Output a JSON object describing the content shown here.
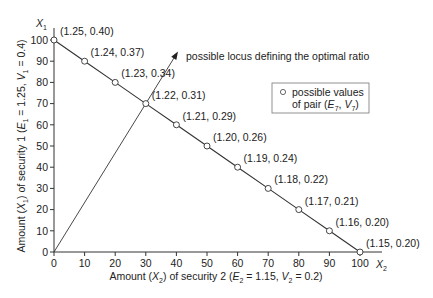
{
  "chart_data": {
    "type": "line",
    "title": "",
    "xlabel": "Amount (X2) of security 2 (E2 = 1.15, V2 = 0.2)",
    "ylabel": "Amount (X1) of security 1 (E1 = 1.25, V1 = 0.4)",
    "x_axis_symbol": "X2",
    "y_axis_symbol": "X1",
    "xlim": [
      0,
      100
    ],
    "ylim": [
      0,
      100
    ],
    "x_ticks": [
      0,
      10,
      20,
      30,
      40,
      50,
      60,
      70,
      80,
      90,
      100
    ],
    "y_ticks": [
      0,
      10,
      20,
      30,
      40,
      50,
      60,
      70,
      80,
      90,
      100
    ],
    "grid": false,
    "series": [
      {
        "name": "possible values of pair (E7, V7)",
        "x": [
          0,
          10,
          20,
          30,
          40,
          50,
          60,
          70,
          80,
          90,
          100
        ],
        "y": [
          100,
          90,
          80,
          70,
          60,
          50,
          40,
          30,
          20,
          10,
          0
        ],
        "labels": [
          "(1.25, 0.40)",
          "(1.24, 0.37)",
          "(1.23, 0.34)",
          "(1.22, 0.31)",
          "(1.21, 0.29)",
          "(1.20, 0.26)",
          "(1.19, 0.24)",
          "(1.18, 0.22)",
          "(1.17, 0.21)",
          "(1.16, 0.20)",
          "(1.15, 0.20)"
        ]
      },
      {
        "name": "possible locus defining the optimal ratio",
        "x": [
          0,
          30
        ],
        "y": [
          0,
          70
        ],
        "arrow": true
      }
    ],
    "annotations": [
      {
        "text": "possible locus defining the optimal ratio"
      }
    ],
    "legend": {
      "position": "upper right",
      "entries": [
        {
          "marker": "open-circle",
          "line1": "possible values",
          "line2_prefix": "of pair (",
          "E": "E",
          "E_sub": "7",
          "V": "V",
          "V_sub": "7"
        }
      ]
    }
  },
  "axes": {
    "y_title": {
      "pre": "Amount (",
      "var": "X",
      "var_sub": "1",
      "mid": ") of security 1 (",
      "e": "E",
      "e_sub": "1",
      "e_val": " = 1.25, ",
      "v": "V",
      "v_sub": "1",
      "v_val": " = 0.4)"
    },
    "x_title": {
      "pre": "Amount (",
      "var": "X",
      "var_sub": "2",
      "mid": ") of security 2 (",
      "e": "E",
      "e_sub": "2",
      "e_val": " = 1.15, ",
      "v": "V",
      "v_sub": "2",
      "v_val": " = 0.2)"
    },
    "x_symbol": {
      "var": "X",
      "sub": "2"
    },
    "y_symbol": {
      "var": "X",
      "sub": "1"
    }
  },
  "locus_label": "possible locus defining the optimal ratio",
  "legend": {
    "line1": "possible values",
    "line2_pre": "of pair (",
    "e": "E",
    "e_sub": "7",
    "comma": ", ",
    "v": "V",
    "v_sub": "7",
    "close": ")"
  }
}
